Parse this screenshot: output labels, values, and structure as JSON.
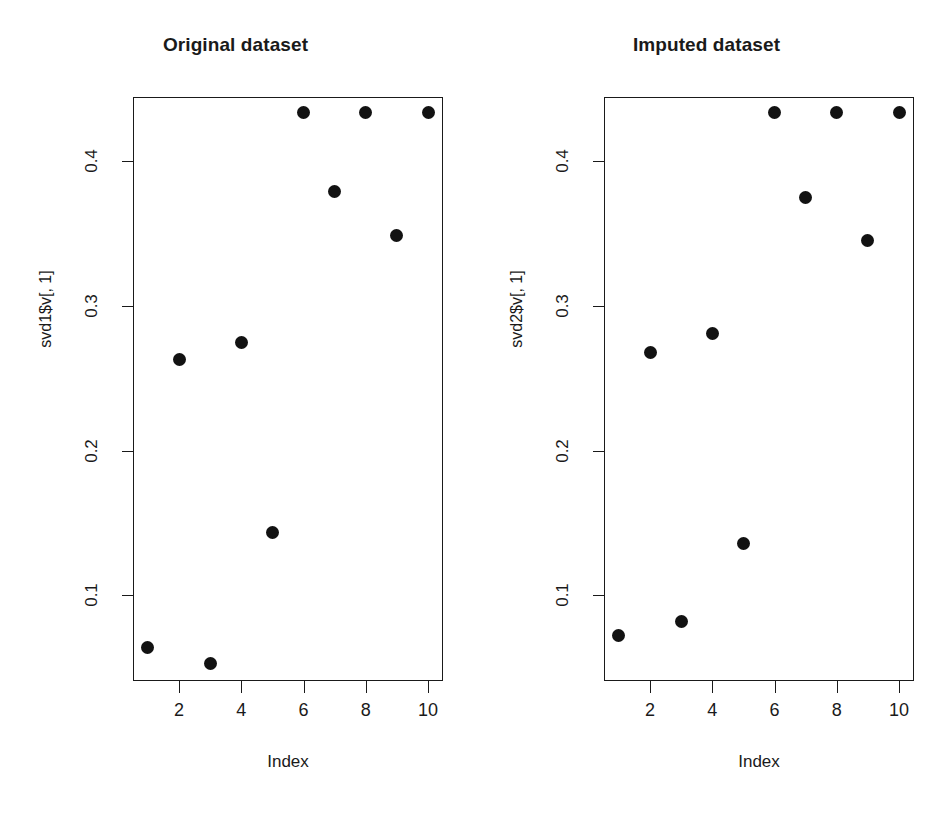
{
  "figure": {
    "background": "#ffffff",
    "point_color": "#121212",
    "axis_color": "#1a1a1a"
  },
  "chart_data": [
    {
      "type": "scatter",
      "title": "Original dataset",
      "xlabel": "Index",
      "ylabel": "svd1$v[, 1]",
      "x": [
        1,
        2,
        3,
        4,
        5,
        6,
        7,
        8,
        9,
        10
      ],
      "values": [
        0.064,
        0.263,
        0.053,
        0.275,
        0.143,
        0.434,
        0.379,
        0.434,
        0.349,
        0.434
      ],
      "xticks": [
        2,
        4,
        6,
        8,
        10
      ],
      "xtick_labels": [
        "2",
        "4",
        "6",
        "8",
        "10"
      ],
      "yticks": [
        0.1,
        0.2,
        0.3,
        0.4
      ],
      "ytick_labels": [
        "0.1",
        "0.2",
        "0.3",
        "0.4"
      ],
      "xlim": [
        0.52,
        10.48
      ],
      "ylim": [
        0.0406,
        0.4445
      ],
      "grid": false,
      "legend": false,
      "marker": "filled-circle"
    },
    {
      "type": "scatter",
      "title": "Imputed dataset",
      "xlabel": "Index",
      "ylabel": "svd2$v[, 1]",
      "x": [
        1,
        2,
        3,
        4,
        5,
        6,
        7,
        8,
        9,
        10
      ],
      "values": [
        0.072,
        0.268,
        0.082,
        0.281,
        0.136,
        0.434,
        0.375,
        0.434,
        0.345,
        0.434
      ],
      "xticks": [
        2,
        4,
        6,
        8,
        10
      ],
      "xtick_labels": [
        "2",
        "4",
        "6",
        "8",
        "10"
      ],
      "yticks": [
        0.1,
        0.2,
        0.3,
        0.4
      ],
      "ytick_labels": [
        "0.1",
        "0.2",
        "0.3",
        "0.4"
      ],
      "xlim": [
        0.52,
        10.48
      ],
      "ylim": [
        0.0406,
        0.4445
      ],
      "grid": false,
      "legend": false,
      "marker": "filled-circle"
    }
  ]
}
